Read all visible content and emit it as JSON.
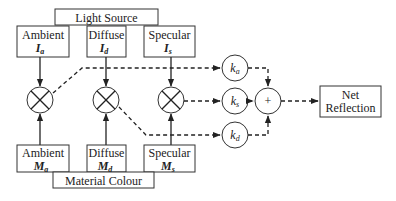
{
  "diagram": {
    "light_source": {
      "title": "Light Source"
    },
    "light_components": [
      {
        "label": "Ambient",
        "symbol": "I",
        "subscript": "a"
      },
      {
        "label": "Diffuse",
        "symbol": "I",
        "subscript": "d"
      },
      {
        "label": "Specular",
        "symbol": "I",
        "subscript": "s"
      }
    ],
    "material_components": [
      {
        "label": "Ambient",
        "symbol": "M",
        "subscript": "a"
      },
      {
        "label": "Diffuse",
        "symbol": "M",
        "subscript": "d"
      },
      {
        "label": "Specular",
        "symbol": "M",
        "subscript": "s"
      }
    ],
    "material": {
      "title": "Material Colour"
    },
    "coefficients": [
      {
        "symbol": "k",
        "subscript": "a"
      },
      {
        "symbol": "k",
        "subscript": "s"
      },
      {
        "symbol": "k",
        "subscript": "d"
      }
    ],
    "sum": {
      "symbol": "+"
    },
    "output": {
      "line1": "Net",
      "line2": "Reflection"
    },
    "multiplier_icon": "multiply-circle-icon",
    "colors": {
      "stroke": "#222222",
      "background": "#ffffff"
    }
  }
}
